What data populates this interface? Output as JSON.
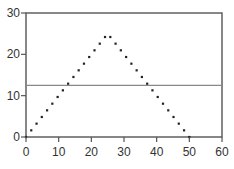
{
  "chart_data": {
    "type": "scatter",
    "title": "",
    "xlabel": "",
    "ylabel": "",
    "xlim": [
      0,
      60
    ],
    "ylim": [
      0,
      30
    ],
    "xticks": [
      0,
      10,
      20,
      30,
      40,
      50,
      60
    ],
    "yticks": [
      0,
      10,
      20,
      30
    ],
    "xtick_labels": [
      "0",
      "10",
      "20",
      "30",
      "40",
      "50",
      "60"
    ],
    "ytick_labels": [
      "0",
      "10",
      "20",
      "30"
    ],
    "grid": false,
    "legend": null,
    "series": [
      {
        "name": "triangle",
        "marker": "dot",
        "color": "#222222",
        "x": [
          0,
          1.61,
          3.23,
          4.84,
          6.45,
          8.06,
          9.68,
          11.29,
          12.9,
          14.52,
          16.13,
          17.74,
          19.35,
          20.97,
          22.58,
          24.19,
          25.81,
          27.42,
          29.03,
          30.65,
          32.26,
          33.87,
          35.48,
          37.1,
          38.71,
          40.32,
          41.94,
          43.55,
          45.16,
          46.77,
          48.39,
          50
        ],
        "y": [
          0,
          1.61,
          3.23,
          4.84,
          6.45,
          8.06,
          9.68,
          11.29,
          12.9,
          14.52,
          16.13,
          17.74,
          19.35,
          20.97,
          22.58,
          24.19,
          24.19,
          22.58,
          20.97,
          19.35,
          17.74,
          16.13,
          14.52,
          12.9,
          11.29,
          9.68,
          8.06,
          6.45,
          4.84,
          3.23,
          1.61,
          0
        ]
      }
    ],
    "hlines": [
      {
        "y": 12.5,
        "color": "#888888"
      }
    ]
  }
}
